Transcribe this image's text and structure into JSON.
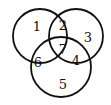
{
  "diagram": {
    "type": "venn",
    "sets": 3,
    "stroke_color": "#111111",
    "background": "#ffffff",
    "circles": [
      {
        "id": "top-left",
        "cx": 40,
        "cy": 36,
        "r": 27
      },
      {
        "id": "top-right",
        "cx": 76,
        "cy": 36,
        "r": 27
      },
      {
        "id": "bottom",
        "cx": 61,
        "cy": 67,
        "r": 30
      }
    ],
    "regions": [
      {
        "label": "1",
        "x": 37,
        "y": 26
      },
      {
        "label": "2",
        "x": 63,
        "y": 25
      },
      {
        "label": "3",
        "x": 88,
        "y": 37
      },
      {
        "label": "4",
        "x": 76,
        "y": 60
      },
      {
        "label": "5",
        "x": 63,
        "y": 84
      },
      {
        "label": "6",
        "x": 38,
        "y": 62
      },
      {
        "label": "7",
        "x": 63,
        "y": 49
      }
    ]
  }
}
